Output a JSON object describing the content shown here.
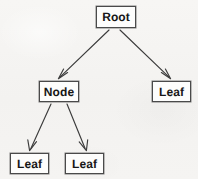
{
  "diagram": {
    "background_color": "#f5f4f2",
    "stroke_color": "#3c3c3c",
    "box_fill_color": "#fdfdfc",
    "text_color": "#171717",
    "nodes": [
      {
        "id": "root",
        "label": "Root",
        "role": "root",
        "x": 96,
        "y": 6,
        "width": 40,
        "height": 22
      },
      {
        "id": "node",
        "label": "Node",
        "role": "internal-node",
        "x": 39,
        "y": 81,
        "width": 40,
        "height": 21
      },
      {
        "id": "leaf-right",
        "label": "Leaf",
        "role": "leaf",
        "x": 152,
        "y": 81,
        "width": 39,
        "height": 21
      },
      {
        "id": "leaf-left",
        "label": "Leaf",
        "role": "leaf",
        "x": 10,
        "y": 153,
        "width": 39,
        "height": 21
      },
      {
        "id": "leaf-middle",
        "label": "Leaf",
        "role": "leaf",
        "x": 65,
        "y": 153,
        "width": 39,
        "height": 21
      }
    ],
    "edges": [
      {
        "id": "root-to-node",
        "from": "root",
        "to": "node",
        "x1": 109,
        "y1": 30,
        "x2": 59,
        "y2": 78,
        "arrowhead": "open"
      },
      {
        "id": "root-to-leaf-right",
        "from": "root",
        "to": "leaf-right",
        "x1": 120,
        "y1": 30,
        "x2": 170,
        "y2": 78,
        "arrowhead": "open"
      },
      {
        "id": "node-to-leaf-left",
        "from": "node",
        "to": "leaf-left",
        "x1": 51,
        "y1": 104,
        "x2": 30,
        "y2": 150,
        "arrowhead": "open"
      },
      {
        "id": "node-to-leaf-middle",
        "from": "node",
        "to": "leaf-middle",
        "x1": 67,
        "y1": 104,
        "x2": 86,
        "y2": 150,
        "arrowhead": "open"
      }
    ]
  }
}
